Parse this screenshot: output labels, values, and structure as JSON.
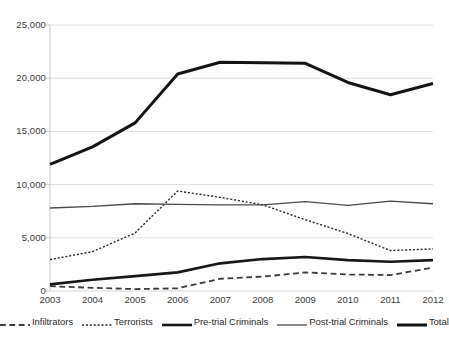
{
  "chart_data": {
    "type": "line",
    "title": "",
    "subtitle": "",
    "xlabel": "",
    "ylabel": "",
    "categories": [
      "2003",
      "2004",
      "2005",
      "2006",
      "2007",
      "2008",
      "2009",
      "2010",
      "2011",
      "2012"
    ],
    "x": [
      2003,
      2004,
      2005,
      2006,
      2007,
      2008,
      2009,
      2010,
      2011,
      2012
    ],
    "ylim": [
      0,
      25000
    ],
    "xlim": [
      2003,
      2012
    ],
    "ytick_values": [
      0,
      5000,
      10000,
      15000,
      20000,
      25000
    ],
    "ytick_labels": [
      "0",
      "5,000",
      "10,000",
      "15,000",
      "20,000",
      "25,000"
    ],
    "grid": "horizontal",
    "legend_position": "bottom",
    "series": [
      {
        "name": "Infiltrators",
        "style": "dashed",
        "width": 1.8,
        "color": "#3a3a3a",
        "values": [
          450,
          300,
          180,
          250,
          1150,
          1350,
          1750,
          1550,
          1500,
          2200
        ]
      },
      {
        "name": "Terrorists",
        "style": "dotted",
        "width": 1.4,
        "color": "#2b2b2b",
        "values": [
          2950,
          3700,
          5450,
          9400,
          8800,
          8100,
          6700,
          5400,
          3800,
          3950
        ]
      },
      {
        "name": "Pre-trial Criminals",
        "style": "solid",
        "width": 2.6,
        "color": "#171717",
        "values": [
          620,
          1050,
          1400,
          1750,
          2600,
          3000,
          3200,
          2900,
          2750,
          2900
        ]
      },
      {
        "name": "Post-trial Criminals",
        "style": "solid",
        "width": 1.3,
        "color": "#4a4a4a",
        "values": [
          7800,
          7950,
          8200,
          8150,
          8100,
          8100,
          8400,
          8050,
          8450,
          8200
        ]
      },
      {
        "name": "Total",
        "style": "solid",
        "width": 3.0,
        "color": "#141414",
        "values": [
          11900,
          13550,
          15800,
          20400,
          21500,
          21450,
          21400,
          19600,
          18450,
          19500
        ]
      }
    ]
  },
  "axes": {
    "y_labels": [
      "25,000",
      "20,000",
      "15,000",
      "10,000",
      "5,000",
      "0"
    ],
    "x_labels": [
      "2003",
      "2004",
      "2005",
      "2006",
      "2007",
      "2008",
      "2009",
      "2010",
      "2011",
      "2012"
    ]
  },
  "legend": {
    "items": [
      {
        "label": "Infiltrators",
        "marker": "dashed-line-swatch"
      },
      {
        "label": "Terrorists",
        "marker": "dotted-line-swatch"
      },
      {
        "label": "Pre-trial Criminals",
        "marker": "thick-solid-line-swatch"
      },
      {
        "label": "Post-trial Criminals",
        "marker": "thin-solid-line-swatch"
      },
      {
        "label": "Total",
        "marker": "thick-solid-line-swatch"
      }
    ]
  },
  "colors": {
    "grid": "#d9d9d9",
    "axis": "#c9c9c9",
    "text": "#3a3a3a",
    "background": "#ffffff"
  }
}
